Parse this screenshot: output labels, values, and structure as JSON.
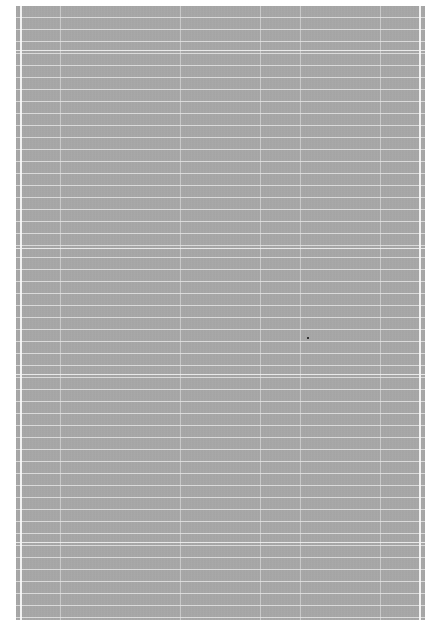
{
  "document": {
    "description": "Blank scanned page with gray noise texture and faint ruled grid lines",
    "background_color": "#a9a9a9",
    "margin_color": "#ffffff",
    "page_bounds": {
      "left": 16,
      "top": 6,
      "right": 425,
      "bottom": 620
    },
    "grid": {
      "horizontal_spacing_px": 12,
      "vertical_lines_x": [
        4,
        44,
        164,
        244,
        284,
        364,
        404
      ]
    },
    "speck": {
      "x": 307,
      "y": 337
    }
  }
}
